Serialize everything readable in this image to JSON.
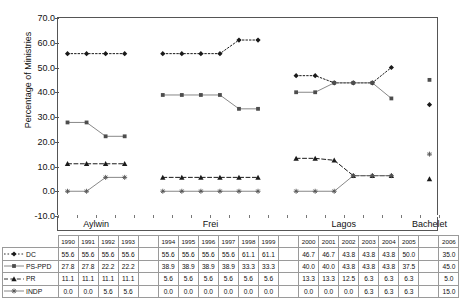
{
  "axis": {
    "ylabel": "Percentage of Ministries",
    "yticks": [
      "70.0",
      "60.0",
      "50.0",
      "40.0",
      "30.0",
      "20.0",
      "10.0",
      "0.0",
      "-10.0"
    ]
  },
  "periods": [
    {
      "name": "Aylwin",
      "years": [
        "1990",
        "1991",
        "1992",
        "1993"
      ]
    },
    {
      "name": "Frei",
      "years": [
        "1994",
        "1995",
        "1996",
        "1997",
        "1998",
        "1999"
      ]
    },
    {
      "name": "Lagos",
      "years": [
        "2000",
        "2001",
        "2002",
        "2003",
        "2004",
        "2005"
      ]
    },
    {
      "name": "Bachelet",
      "years": [
        "2006"
      ]
    }
  ],
  "series": [
    {
      "name": "DC",
      "marker": "diamond",
      "line": "dotted",
      "values": [
        55.6,
        55.6,
        55.6,
        55.6,
        55.6,
        55.6,
        55.6,
        55.6,
        61.1,
        61.1,
        46.7,
        46.7,
        43.8,
        43.8,
        43.8,
        50.0,
        35.0
      ]
    },
    {
      "name": "PS-PPD",
      "marker": "square",
      "line": "solid",
      "values": [
        27.8,
        27.8,
        22.2,
        22.2,
        38.9,
        38.9,
        38.9,
        38.9,
        33.3,
        33.3,
        40.0,
        40.0,
        43.8,
        43.8,
        43.8,
        37.5,
        45.0
      ]
    },
    {
      "name": "PR",
      "marker": "triangle",
      "line": "dashed",
      "values": [
        11.1,
        11.1,
        11.1,
        11.1,
        5.6,
        5.6,
        5.6,
        5.6,
        5.6,
        5.6,
        13.3,
        13.3,
        12.5,
        6.3,
        6.3,
        6.3,
        5.0
      ]
    },
    {
      "name": "INDP",
      "marker": "asterisk",
      "line": "solid",
      "values": [
        0.0,
        0.0,
        5.6,
        5.6,
        0.0,
        0.0,
        0.0,
        0.0,
        0.0,
        0.0,
        0.0,
        0.0,
        0.0,
        6.3,
        6.3,
        6.3,
        15.0
      ]
    }
  ],
  "chart_data": {
    "type": "line",
    "title": "",
    "xlabel": "",
    "ylabel": "Percentage of Ministries",
    "ylim": [
      -10.0,
      70.0
    ],
    "ytick_step": 10.0,
    "grid": false,
    "legend_position": "data-table-row-labels",
    "x": [
      "1990",
      "1991",
      "1992",
      "1993",
      "1994",
      "1995",
      "1996",
      "1997",
      "1998",
      "1999",
      "2000",
      "2001",
      "2002",
      "2003",
      "2004",
      "2005",
      "2006"
    ],
    "group_labels": [
      "Aylwin",
      "Frei",
      "Lagos",
      "Bachelet"
    ],
    "groups": {
      "Aylwin": [
        "1990",
        "1991",
        "1992",
        "1993"
      ],
      "Frei": [
        "1994",
        "1995",
        "1996",
        "1997",
        "1998",
        "1999"
      ],
      "Lagos": [
        "2000",
        "2001",
        "2002",
        "2003",
        "2004",
        "2005"
      ],
      "Bachelet": [
        "2006"
      ]
    },
    "series": [
      {
        "name": "DC",
        "values": [
          55.6,
          55.6,
          55.6,
          55.6,
          55.6,
          55.6,
          55.6,
          55.6,
          61.1,
          61.1,
          46.7,
          46.7,
          43.8,
          43.8,
          43.8,
          50.0,
          35.0
        ]
      },
      {
        "name": "PS-PPD",
        "values": [
          27.8,
          27.8,
          22.2,
          22.2,
          38.9,
          38.9,
          38.9,
          38.9,
          33.3,
          33.3,
          40.0,
          40.0,
          43.8,
          43.8,
          43.8,
          37.5,
          45.0
        ]
      },
      {
        "name": "PR",
        "values": [
          11.1,
          11.1,
          11.1,
          11.1,
          5.6,
          5.6,
          5.6,
          5.6,
          5.6,
          5.6,
          13.3,
          13.3,
          12.5,
          6.3,
          6.3,
          6.3,
          5.0
        ]
      },
      {
        "name": "INDP",
        "values": [
          0.0,
          0.0,
          5.6,
          5.6,
          0.0,
          0.0,
          0.0,
          0.0,
          0.0,
          0.0,
          0.0,
          0.0,
          0.0,
          6.3,
          6.3,
          6.3,
          15.0
        ]
      }
    ]
  }
}
